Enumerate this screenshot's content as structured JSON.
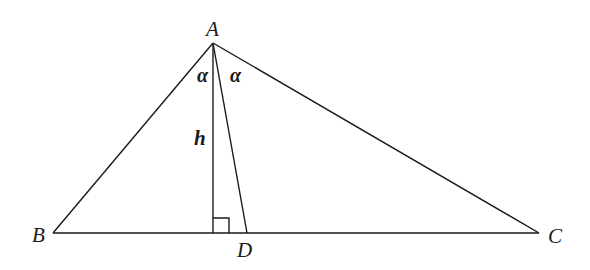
{
  "diagram": {
    "type": "triangle-with-altitude-and-angle-bisector",
    "vertices": {
      "A": {
        "label": "A",
        "x": 213,
        "y": 43
      },
      "B": {
        "label": "B",
        "x": 53,
        "y": 233
      },
      "C": {
        "label": "C",
        "x": 539,
        "y": 233
      }
    },
    "points": {
      "H": {
        "label": "",
        "x": 213,
        "y": 233
      },
      "D": {
        "label": "D",
        "x": 247,
        "y": 233
      }
    },
    "labels": {
      "A": "A",
      "B": "B",
      "C": "C",
      "D": "D",
      "h": "h",
      "alpha_left": "α",
      "alpha_right": "α"
    },
    "segments": [
      {
        "name": "AB",
        "from": "A",
        "to": "B"
      },
      {
        "name": "AC",
        "from": "A",
        "to": "C"
      },
      {
        "name": "BC",
        "from": "B",
        "to": "C"
      },
      {
        "name": "altitude-AH",
        "from": "A",
        "to": "H",
        "label": "h"
      },
      {
        "name": "bisector-AD",
        "from": "A",
        "to": "D"
      }
    ],
    "right_angle_marker": {
      "at": "H",
      "size": 16
    },
    "colors": {
      "stroke": "#1a1a1a",
      "background": "#ffffff"
    }
  }
}
